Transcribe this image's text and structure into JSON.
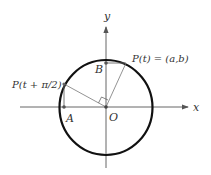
{
  "figure": {
    "axes": {
      "x_label": "x",
      "y_label": "y"
    },
    "origin_label": "O",
    "points": {
      "P_t": {
        "label": "P(t) = (a,b)"
      },
      "P_t_plus": {
        "label": "P(t + π/2)"
      },
      "A": {
        "label": "A"
      },
      "B": {
        "label": "B"
      }
    },
    "right_angle_marker": true,
    "colors": {
      "circle": "#111111",
      "axes": "#555555",
      "segments": "#666666",
      "points": "#444444"
    }
  }
}
